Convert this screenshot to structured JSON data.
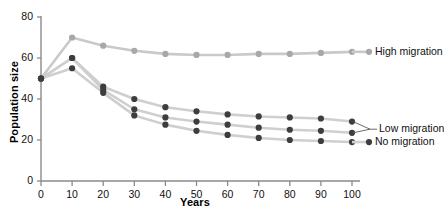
{
  "chart_data": {
    "type": "line",
    "title": "",
    "xlabel": "Years",
    "ylabel": "Population size",
    "xlim": [
      0,
      100
    ],
    "ylim": [
      0,
      80
    ],
    "xticks": [
      0,
      10,
      20,
      30,
      40,
      50,
      60,
      70,
      80,
      90,
      100
    ],
    "yticks": [
      0,
      20,
      40,
      60,
      80
    ],
    "grid": false,
    "legend_position": "right-inline",
    "x": [
      0,
      10,
      20,
      30,
      40,
      50,
      60,
      70,
      80,
      90,
      100
    ],
    "series": [
      {
        "name": "High migration",
        "color": "#c9c9c9",
        "marker_color": "#a8a8a8",
        "values": [
          50,
          70,
          66,
          63.5,
          62,
          61.5,
          61.5,
          62,
          62,
          62.5,
          63
        ]
      },
      {
        "name": "Low migration",
        "color": "#cfcfcf",
        "marker_color": "#3d3d3d",
        "values": [
          50,
          60,
          46,
          40,
          36,
          34,
          32.5,
          31.5,
          31,
          30.5,
          29
        ]
      },
      {
        "name": "Low migration",
        "color": "#cfcfcf",
        "marker_color": "#3d3d3d",
        "values": [
          50,
          60,
          44.5,
          35,
          31,
          29,
          27.5,
          26,
          25,
          24.5,
          23.5
        ]
      },
      {
        "name": "No migration",
        "color": "#cfcfcf",
        "marker_color": "#3d3d3d",
        "values": [
          50,
          55,
          43,
          32,
          27.5,
          24.5,
          22.5,
          21,
          20,
          19.5,
          19
        ]
      }
    ],
    "legend": [
      {
        "label": "High migration",
        "color": "#a8a8a8"
      },
      {
        "label": "Low migration",
        "color": "#3d3d3d"
      },
      {
        "label": "No migration",
        "color": "#3d3d3d"
      }
    ]
  },
  "xtick_labels": [
    "0",
    "10",
    "20",
    "30",
    "40",
    "50",
    "60",
    "70",
    "80",
    "90",
    "100"
  ],
  "ytick_labels": [
    "0",
    "20",
    "40",
    "60",
    "80"
  ],
  "axis": {
    "x_title": "Years",
    "y_title": "Population size"
  },
  "legend": {
    "high": "High migration",
    "low": "Low migration",
    "none": "No migration"
  }
}
